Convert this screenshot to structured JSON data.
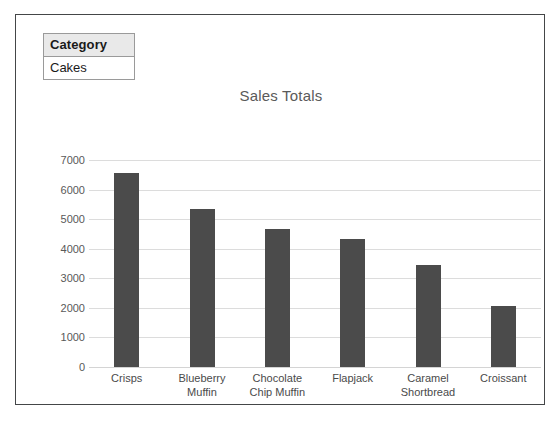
{
  "filter": {
    "header": "Category",
    "value": "Cakes"
  },
  "chart_data": {
    "type": "bar",
    "title": "Sales Totals",
    "xlabel": "",
    "ylabel": "",
    "categories": [
      "Crisps",
      "Blueberry Muffin",
      "Chocolate Chip Muffin",
      "Flapjack",
      "Caramel Shortbread",
      "Croissant"
    ],
    "category_lines": [
      [
        "Crisps"
      ],
      [
        "Blueberry",
        "Muffin"
      ],
      [
        "Chocolate",
        "Chip Muffin"
      ],
      [
        "Flapjack"
      ],
      [
        "Caramel",
        "Shortbread"
      ],
      [
        "Croissant"
      ]
    ],
    "values": [
      6550,
      5350,
      4680,
      4330,
      3460,
      2080
    ],
    "ylim": [
      0,
      7000
    ],
    "yticks": [
      7000,
      6000,
      5000,
      4000,
      3000,
      2000,
      1000,
      0
    ],
    "ytick_labels": [
      "7000",
      "6000",
      "5000",
      "4000",
      "3000",
      "2000",
      "1000",
      "0"
    ],
    "grid": true,
    "legend": false,
    "bar_color": "#4b4b4b",
    "title_color": "#5a5a5a",
    "grid_color": "#dcdcdc"
  }
}
